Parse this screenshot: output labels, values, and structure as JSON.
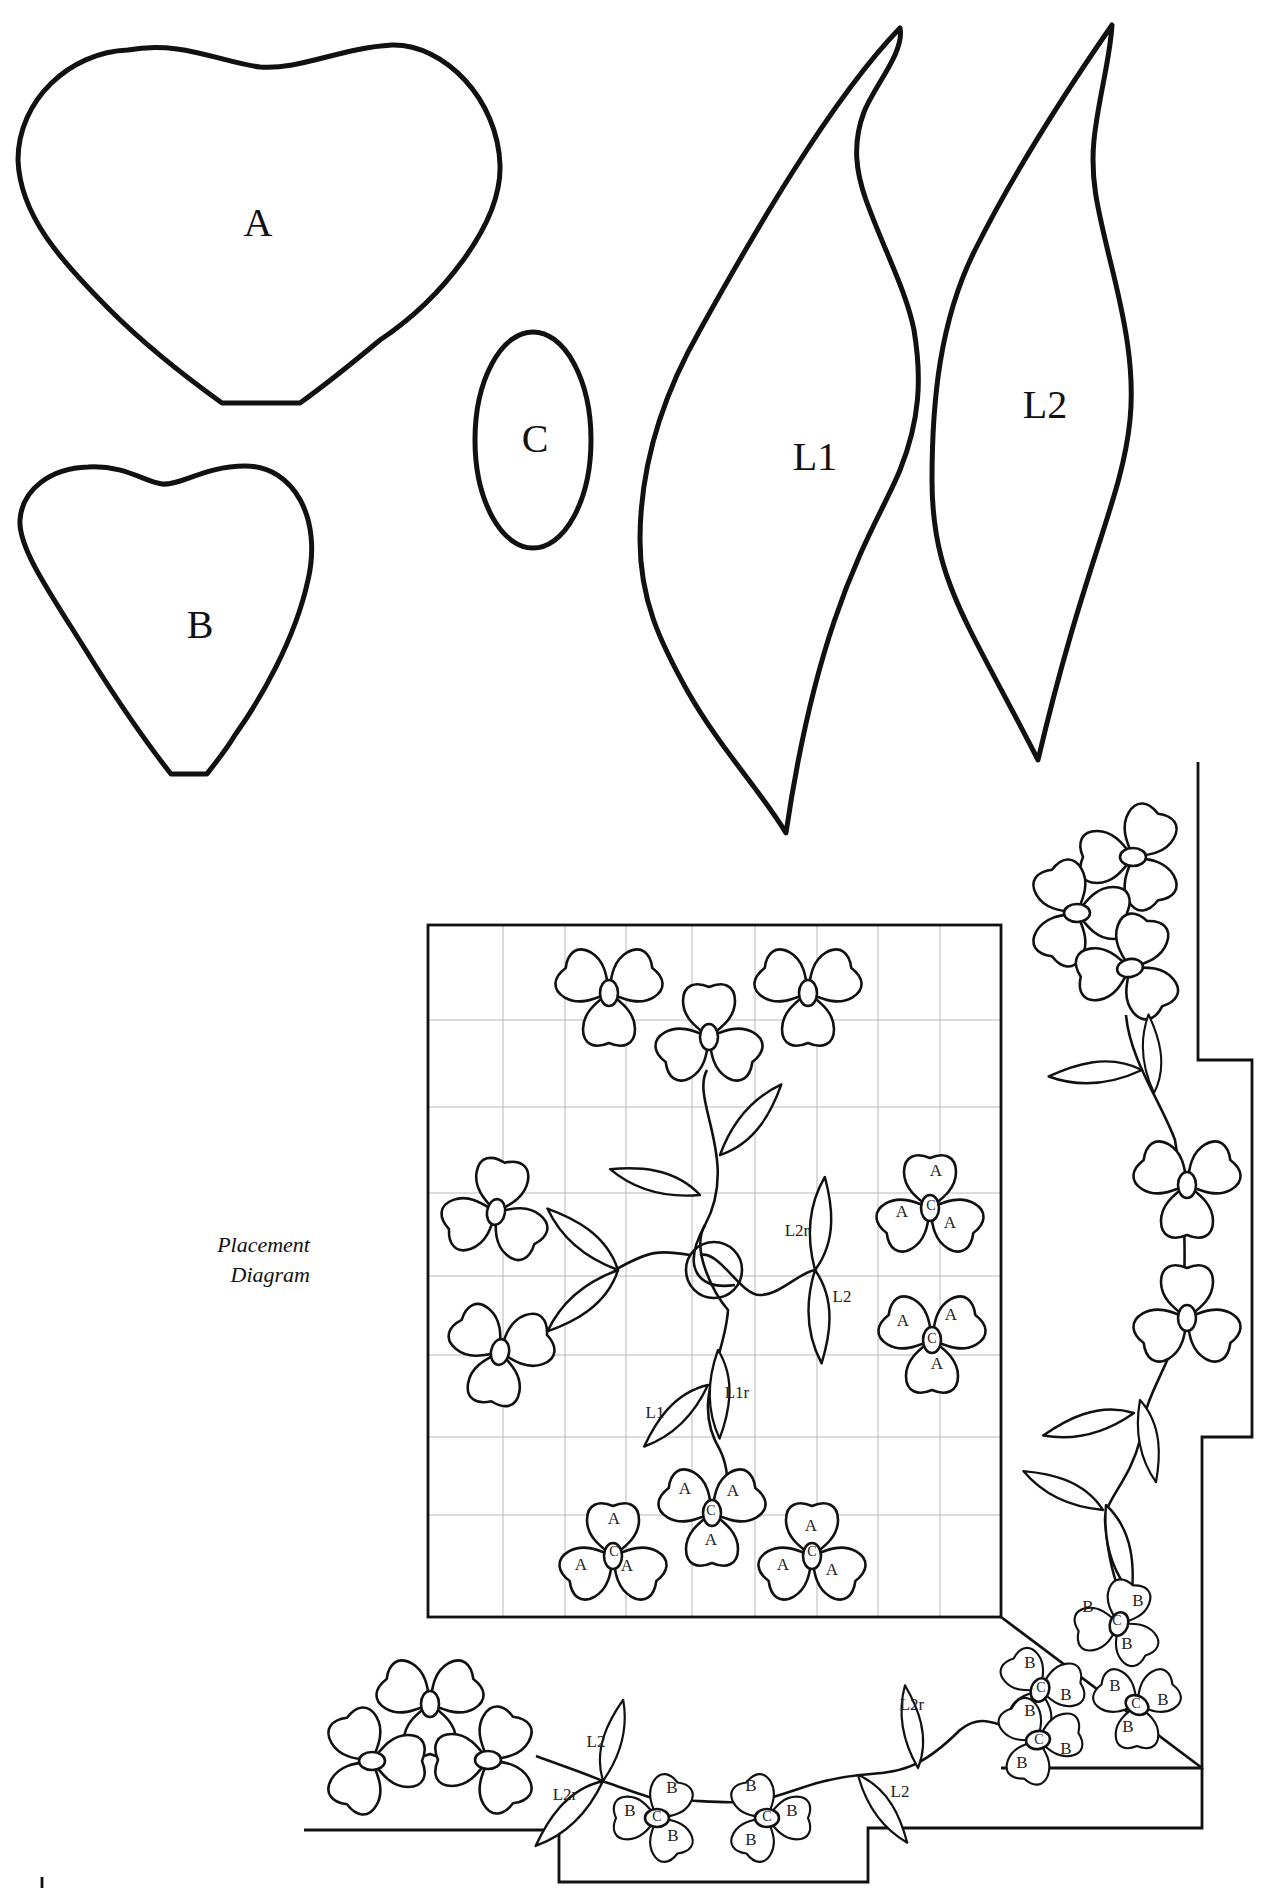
{
  "templates": {
    "A": {
      "label": "A",
      "shape": "heart-petal-large"
    },
    "B": {
      "label": "B",
      "shape": "heart-petal-small"
    },
    "C": {
      "label": "C",
      "shape": "oval-center"
    },
    "L1": {
      "label": "L1",
      "shape": "leaf-large"
    },
    "L2": {
      "label": "L2",
      "shape": "leaf-slender"
    }
  },
  "caption": {
    "line1": "Placement",
    "line2": "Diagram"
  },
  "block": {
    "labels": {
      "l2r": "L2r",
      "l2": "L2",
      "l1": "L1",
      "l1r": "L1r"
    },
    "petal_label": "A",
    "center_label": "C"
  },
  "border": {
    "petal_label": "B",
    "center_label": "C",
    "leaf_labels": {
      "left_l2": "L2",
      "left_l2r": "L2r",
      "right_l2r": "L2r",
      "right_l2": "L2"
    }
  },
  "colors": {
    "ink": "#111111",
    "paper": "#ffffff",
    "grid": "#b8b8b8"
  }
}
